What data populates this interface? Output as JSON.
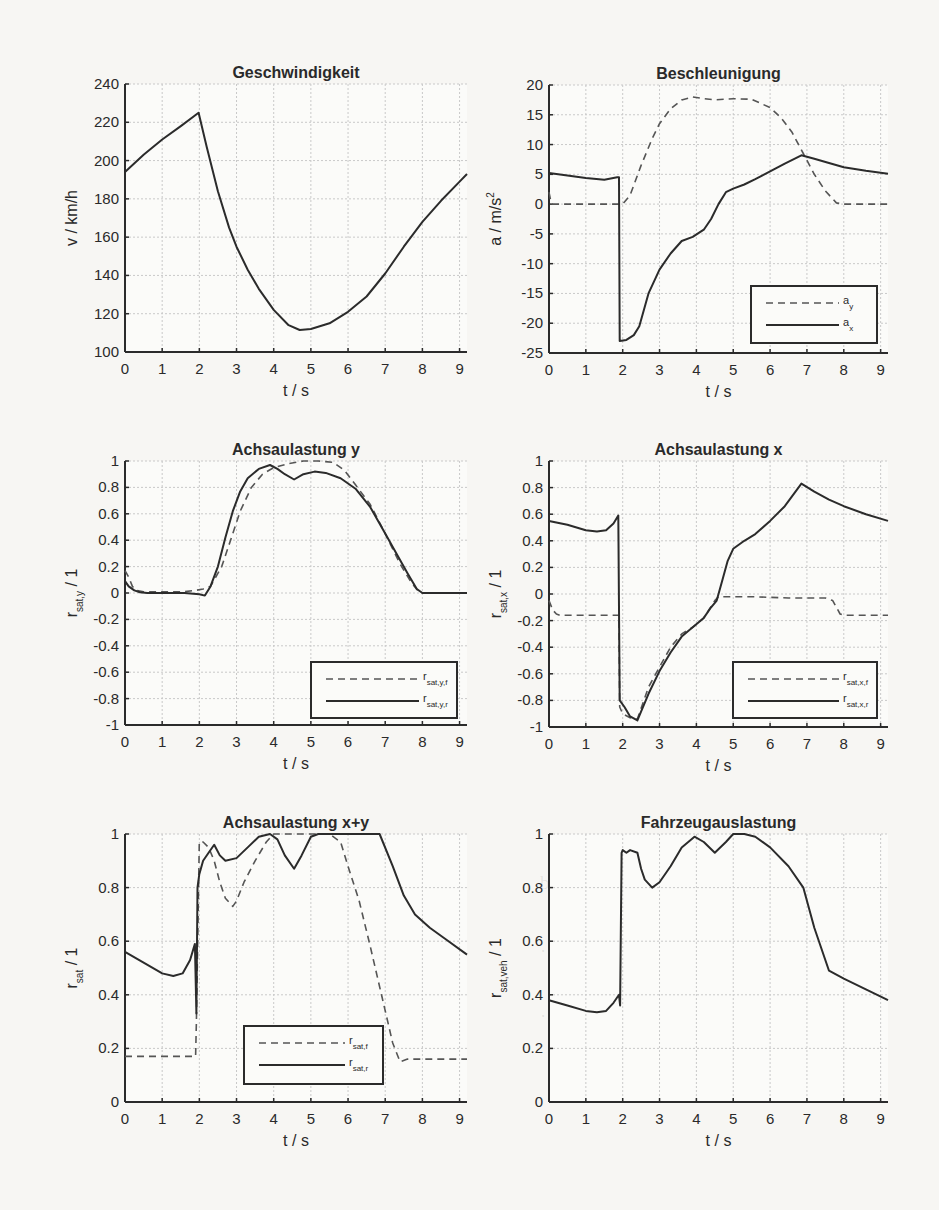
{
  "figure": {
    "width": 939,
    "height": 1210,
    "line_color": "#2b2b2b",
    "grid_color": "#c9c9c9",
    "background": "#f7f6f3"
  },
  "chart_data": [
    {
      "id": "geschwindigkeit",
      "type": "line",
      "title": "Geschwindigkeit",
      "xlabel": "t  / s",
      "ylabel": "v / km/h",
      "ylabel_sub": "",
      "xlim": [
        0,
        9.2
      ],
      "ylim": [
        100,
        240
      ],
      "xticks": [
        0,
        1,
        2,
        3,
        4,
        5,
        6,
        7,
        8,
        9
      ],
      "yticks": [
        100,
        120,
        140,
        160,
        180,
        200,
        220,
        240
      ],
      "ytick_labels": [
        "100",
        "120",
        "140",
        "160",
        "180",
        "200",
        "220",
        "240"
      ],
      "grid": true,
      "box": {
        "left": 125,
        "right": 467,
        "top": 84,
        "bottom": 352
      },
      "legend": null,
      "series": [
        {
          "name": "v",
          "style": "solid",
          "x": [
            0,
            0.5,
            1.0,
            1.5,
            1.98,
            2.2,
            2.5,
            2.8,
            3.0,
            3.3,
            3.6,
            4.0,
            4.4,
            4.7,
            5.0,
            5.5,
            6.0,
            6.5,
            7.0,
            7.5,
            8.0,
            8.5,
            9.0,
            9.2
          ],
          "y": [
            194,
            203,
            211,
            218,
            225,
            207,
            184,
            165,
            155,
            143,
            133,
            122,
            114,
            111.5,
            112,
            115,
            121,
            129,
            141,
            155,
            168,
            179,
            189,
            193
          ]
        }
      ]
    },
    {
      "id": "beschleunigung",
      "type": "line",
      "title": "Beschleunigung",
      "xlabel": "t  / s",
      "ylabel": "a / m/s",
      "ylabel_sup": "2",
      "ylabel_sub": "",
      "xlim": [
        0,
        9.2
      ],
      "ylim": [
        -25,
        20
      ],
      "xticks": [
        0,
        1,
        2,
        3,
        4,
        5,
        6,
        7,
        8,
        9
      ],
      "yticks": [
        -25,
        -20,
        -15,
        -10,
        -5,
        0,
        5,
        10,
        15,
        20
      ],
      "ytick_labels": [
        "-25",
        "-20",
        "-15",
        "-10",
        "-5",
        "0",
        "5",
        "10",
        "15",
        "20"
      ],
      "grid": true,
      "box": {
        "left": 549,
        "right": 888,
        "top": 85,
        "bottom": 353
      },
      "legend": {
        "x": 751,
        "y": 286,
        "w": 126,
        "h": 57,
        "entries": [
          {
            "label": "a",
            "sub": "y",
            "style": "dashed"
          },
          {
            "label": "a",
            "sub": "x",
            "style": "solid"
          }
        ]
      },
      "series": [
        {
          "name": "a_y",
          "style": "dashed",
          "x": [
            0,
            0.05,
            0.1,
            1.0,
            2.0,
            2.2,
            2.5,
            2.8,
            3.0,
            3.3,
            3.6,
            3.9,
            4.2,
            4.5,
            5.0,
            5.5,
            6.0,
            6.3,
            6.6,
            6.9,
            7.2,
            7.5,
            7.8,
            8.0,
            9.2
          ],
          "y": [
            2.0,
            0.5,
            0,
            0,
            0,
            1.5,
            6.5,
            11,
            13.5,
            16,
            17.5,
            18,
            17.7,
            17.5,
            17.7,
            17.6,
            16.2,
            14.5,
            12,
            8.5,
            5,
            2.2,
            0.2,
            0,
            0
          ]
        },
        {
          "name": "a_x",
          "style": "solid",
          "x": [
            0,
            0.5,
            1.0,
            1.5,
            1.85,
            1.9,
            1.92,
            2.1,
            2.3,
            2.45,
            2.7,
            3.0,
            3.3,
            3.6,
            3.9,
            4.2,
            4.4,
            4.6,
            4.8,
            5.0,
            5.3,
            5.6,
            6.0,
            6.4,
            6.85,
            7.2,
            7.6,
            8.0,
            8.6,
            9.2
          ],
          "y": [
            5.2,
            4.8,
            4.4,
            4.1,
            4.5,
            4.5,
            -23,
            -22.8,
            -22,
            -20.5,
            -15,
            -11,
            -8.3,
            -6.2,
            -5.5,
            -4.3,
            -2.5,
            0,
            2,
            2.6,
            3.3,
            4.2,
            5.5,
            6.8,
            8.2,
            7.6,
            6.9,
            6.2,
            5.6,
            5.1
          ]
        }
      ]
    },
    {
      "id": "achsaulastung-y",
      "type": "line",
      "title": "Achsaulastung y",
      "xlabel": "t  / s",
      "ylabel": "r",
      "ylabel_sub": "sat,y",
      "ylabel_tail": " / 1",
      "xlim": [
        0,
        9.2
      ],
      "ylim": [
        -1,
        1
      ],
      "xticks": [
        0,
        1,
        2,
        3,
        4,
        5,
        6,
        7,
        8,
        9
      ],
      "yticks": [
        -1,
        -0.8,
        -0.6,
        -0.4,
        -0.2,
        0,
        0.2,
        0.4,
        0.6,
        0.8,
        1
      ],
      "ytick_labels": [
        "-1",
        "-0.8",
        "-0.6",
        "-0.4",
        "-0.2",
        "0",
        "0.2",
        "0.4",
        "0.6",
        "0.8",
        "1"
      ],
      "grid": true,
      "box": {
        "left": 125,
        "right": 467,
        "top": 461,
        "bottom": 725
      },
      "legend": {
        "x": 311,
        "y": 662,
        "w": 146,
        "h": 56,
        "entries": [
          {
            "label": "r",
            "sub": "sat,y,f",
            "style": "dashed"
          },
          {
            "label": "r",
            "sub": "sat,y,r",
            "style": "solid"
          }
        ]
      },
      "series": [
        {
          "name": "r_sat,y,f",
          "style": "dashed",
          "x": [
            0,
            0.1,
            0.2,
            0.3,
            0.5,
            1.0,
            1.6,
            1.9,
            2.1,
            2.3,
            2.6,
            2.9,
            3.1,
            3.4,
            3.7,
            4.0,
            4.4,
            4.8,
            5.2,
            5.6,
            5.9,
            6.2,
            6.6,
            7.0,
            7.4,
            7.7,
            7.9,
            8.0,
            9.2
          ],
          "y": [
            0.17,
            0.12,
            0.05,
            0.02,
            0.01,
            0.01,
            0.01,
            0.02,
            0.03,
            0.05,
            0.2,
            0.45,
            0.62,
            0.8,
            0.9,
            0.95,
            0.98,
            1.0,
            1.0,
            0.99,
            0.93,
            0.82,
            0.67,
            0.45,
            0.22,
            0.08,
            0.01,
            0,
            0
          ]
        },
        {
          "name": "r_sat,y,r",
          "style": "solid",
          "x": [
            0,
            0.1,
            0.25,
            0.4,
            0.6,
            1.0,
            1.6,
            2.0,
            2.15,
            2.3,
            2.5,
            2.7,
            2.9,
            3.1,
            3.3,
            3.6,
            3.9,
            4.1,
            4.3,
            4.55,
            4.8,
            5.1,
            5.4,
            5.8,
            6.2,
            6.6,
            7.0,
            7.3,
            7.6,
            7.85,
            8.0,
            9.2
          ],
          "y": [
            0.09,
            0.05,
            0.02,
            0.005,
            0,
            0,
            0,
            -0.01,
            -0.02,
            0.05,
            0.2,
            0.42,
            0.62,
            0.77,
            0.87,
            0.94,
            0.97,
            0.94,
            0.9,
            0.86,
            0.9,
            0.92,
            0.91,
            0.87,
            0.79,
            0.65,
            0.45,
            0.3,
            0.15,
            0.03,
            0,
            0
          ]
        }
      ]
    },
    {
      "id": "achsaulastung-x",
      "type": "line",
      "title": "Achsaulastung x",
      "xlabel": "t  / s",
      "ylabel": "r",
      "ylabel_sub": "sat,x",
      "ylabel_tail": " / 1",
      "xlim": [
        0,
        9.2
      ],
      "ylim": [
        -1,
        1
      ],
      "xticks": [
        0,
        1,
        2,
        3,
        4,
        5,
        6,
        7,
        8,
        9
      ],
      "yticks": [
        -1,
        -0.8,
        -0.6,
        -0.4,
        -0.2,
        0,
        0.2,
        0.4,
        0.6,
        0.8,
        1
      ],
      "ytick_labels": [
        "-1",
        "-0.8",
        "-0.6",
        "-0.4",
        "-0.2",
        "0",
        "0.2",
        "0.4",
        "0.6",
        "0.8",
        "1"
      ],
      "grid": true,
      "box": {
        "left": 549,
        "right": 888,
        "top": 461,
        "bottom": 727
      },
      "legend": {
        "x": 733,
        "y": 662,
        "w": 144,
        "h": 56,
        "entries": [
          {
            "label": "r",
            "sub": "sat,x,f",
            "style": "dashed"
          },
          {
            "label": "r",
            "sub": "sat,x,r",
            "style": "solid"
          }
        ]
      },
      "series": [
        {
          "name": "r_sat,x,f",
          "style": "dashed",
          "x": [
            0,
            0.1,
            0.2,
            0.3,
            1.0,
            1.9,
            1.92,
            2.0,
            2.2,
            2.4,
            2.7,
            3.0,
            3.3,
            3.6,
            3.9,
            4.2,
            4.5,
            4.6,
            5.5,
            6.5,
            7.5,
            7.7,
            7.9,
            8.0,
            9.2
          ],
          "y": [
            -0.05,
            -0.12,
            -0.15,
            -0.16,
            -0.16,
            -0.16,
            -0.85,
            -0.9,
            -0.93,
            -0.94,
            -0.7,
            -0.55,
            -0.4,
            -0.3,
            -0.25,
            -0.18,
            -0.05,
            -0.02,
            -0.02,
            -0.03,
            -0.03,
            -0.05,
            -0.15,
            -0.16,
            -0.16
          ]
        },
        {
          "name": "r_sat,x,r",
          "style": "solid",
          "x": [
            0,
            0.5,
            1.0,
            1.3,
            1.55,
            1.75,
            1.88,
            1.92,
            2.05,
            2.2,
            2.4,
            2.7,
            3.0,
            3.3,
            3.6,
            3.9,
            4.2,
            4.4,
            4.55,
            4.7,
            4.85,
            5.0,
            5.3,
            5.6,
            6.0,
            6.4,
            6.85,
            7.2,
            7.6,
            8.0,
            8.6,
            9.2
          ],
          "y": [
            0.55,
            0.52,
            0.48,
            0.47,
            0.48,
            0.53,
            0.59,
            -0.8,
            -0.85,
            -0.92,
            -0.95,
            -0.75,
            -0.58,
            -0.44,
            -0.32,
            -0.25,
            -0.18,
            -0.1,
            -0.05,
            0.1,
            0.25,
            0.34,
            0.4,
            0.45,
            0.55,
            0.66,
            0.83,
            0.77,
            0.71,
            0.66,
            0.6,
            0.55
          ]
        }
      ]
    },
    {
      "id": "achsaulastung-xy",
      "type": "line",
      "title": "Achsaulastung x+y",
      "xlabel": "t  / s",
      "ylabel": "r",
      "ylabel_sub": "sat",
      "ylabel_tail": " / 1",
      "xlim": [
        0,
        9.2
      ],
      "ylim": [
        0,
        1
      ],
      "xticks": [
        0,
        1,
        2,
        3,
        4,
        5,
        6,
        7,
        8,
        9
      ],
      "yticks": [
        0,
        0.2,
        0.4,
        0.6,
        0.8,
        1
      ],
      "ytick_labels": [
        "0",
        "0.2",
        "0.4",
        "0.6",
        "0.8",
        "1"
      ],
      "grid": true,
      "box": {
        "left": 125,
        "right": 467,
        "top": 834,
        "bottom": 1102
      },
      "legend": {
        "x": 244,
        "y": 1026,
        "w": 139,
        "h": 58,
        "entries": [
          {
            "label": "r",
            "sub": "sat,f",
            "style": "dashed"
          },
          {
            "label": "r",
            "sub": "sat,r",
            "style": "solid"
          }
        ]
      },
      "series": [
        {
          "name": "r_sat,f",
          "style": "dashed",
          "x": [
            0,
            1.0,
            1.9,
            1.92,
            2.0,
            2.1,
            2.25,
            2.4,
            2.55,
            2.7,
            2.9,
            3.0,
            3.2,
            3.5,
            3.8,
            4.0,
            4.5,
            5.0,
            5.5,
            5.8,
            6.0,
            6.3,
            6.6,
            6.9,
            7.2,
            7.4,
            7.6,
            8.0,
            9.2
          ],
          "y": [
            0.17,
            0.17,
            0.17,
            0.3,
            0.97,
            0.97,
            0.95,
            0.9,
            0.82,
            0.76,
            0.73,
            0.75,
            0.82,
            0.9,
            0.97,
            1.0,
            1.0,
            1.0,
            1.0,
            0.97,
            0.88,
            0.75,
            0.58,
            0.4,
            0.22,
            0.15,
            0.16,
            0.16,
            0.16
          ]
        },
        {
          "name": "r_sat,r",
          "style": "solid",
          "x": [
            0,
            0.5,
            1.0,
            1.3,
            1.55,
            1.75,
            1.88,
            1.92,
            1.95,
            2.0,
            2.1,
            2.25,
            2.4,
            2.55,
            2.7,
            3.0,
            3.3,
            3.6,
            3.9,
            4.1,
            4.3,
            4.55,
            4.75,
            5.0,
            5.2,
            5.5,
            6.0,
            6.5,
            6.85,
            7.2,
            7.5,
            7.8,
            8.2,
            8.6,
            9.2
          ],
          "y": [
            0.56,
            0.52,
            0.48,
            0.47,
            0.48,
            0.53,
            0.59,
            0.33,
            0.8,
            0.85,
            0.9,
            0.93,
            0.96,
            0.92,
            0.9,
            0.91,
            0.95,
            0.99,
            1.0,
            0.98,
            0.92,
            0.87,
            0.92,
            0.99,
            1.0,
            1.0,
            1.0,
            1.0,
            1.0,
            0.88,
            0.77,
            0.7,
            0.65,
            0.61,
            0.55
          ]
        }
      ]
    },
    {
      "id": "fahrzeugauslastung",
      "type": "line",
      "title": "Fahrzeugauslastung",
      "xlabel": "t  / s",
      "ylabel": "r",
      "ylabel_sub": "sat,veh",
      "ylabel_tail": " / 1",
      "xlim": [
        0,
        9.2
      ],
      "ylim": [
        0,
        1
      ],
      "xticks": [
        0,
        1,
        2,
        3,
        4,
        5,
        6,
        7,
        8,
        9
      ],
      "yticks": [
        0,
        0.2,
        0.4,
        0.6,
        0.8,
        1
      ],
      "ytick_labels": [
        "0",
        "0.2",
        "0.4",
        "0.6",
        "0.8",
        "1"
      ],
      "grid": true,
      "box": {
        "left": 549,
        "right": 888,
        "top": 834,
        "bottom": 1102
      },
      "legend": null,
      "series": [
        {
          "name": "r_sat,veh",
          "style": "solid",
          "x": [
            0,
            0.5,
            1.0,
            1.3,
            1.55,
            1.75,
            1.9,
            1.93,
            1.97,
            2.0,
            2.1,
            2.2,
            2.4,
            2.5,
            2.6,
            2.8,
            3.0,
            3.3,
            3.6,
            3.95,
            4.2,
            4.5,
            4.8,
            5.0,
            5.3,
            5.6,
            6.0,
            6.5,
            6.9,
            7.2,
            7.6,
            8.0,
            8.6,
            9.2
          ],
          "y": [
            0.38,
            0.36,
            0.34,
            0.335,
            0.34,
            0.37,
            0.4,
            0.36,
            0.93,
            0.94,
            0.93,
            0.94,
            0.93,
            0.87,
            0.83,
            0.8,
            0.82,
            0.88,
            0.95,
            0.99,
            0.97,
            0.93,
            0.97,
            1.0,
            1.0,
            0.99,
            0.95,
            0.88,
            0.8,
            0.65,
            0.49,
            0.46,
            0.42,
            0.38
          ]
        }
      ]
    }
  ]
}
